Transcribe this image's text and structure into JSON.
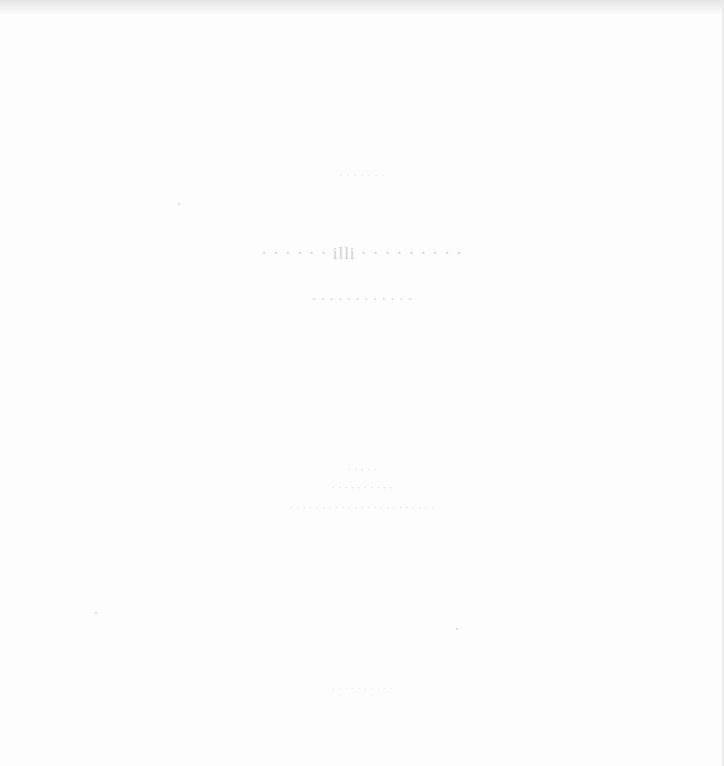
{
  "page": {
    "header_faint": "· · · · · · ·",
    "title": "· · · · · · illi · · · · · · · · ·",
    "subtitle": "· · · · · · · · · · · ·",
    "meta": [
      "· · · · ·",
      "· · · · · · · · · ·",
      "· · · · · · · · · · · · · · · · · · · · · · ·"
    ],
    "footer": "· · · · · · · · · ·"
  }
}
